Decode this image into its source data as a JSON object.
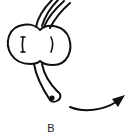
{
  "figure": {
    "panel_label": "B",
    "stroke_color": "#111111",
    "background": "#ffffff",
    "elements": [
      "upper-tube-pair",
      "bilobed-body",
      "lower-tube",
      "curved-arrow"
    ]
  }
}
